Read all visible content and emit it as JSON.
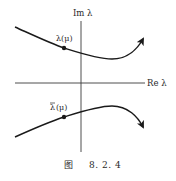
{
  "figure": {
    "caption_prefix": "图",
    "caption_number": "8. 2. 4",
    "axes": {
      "imag_label": "Im λ",
      "real_label": "Re λ"
    },
    "points": {
      "upper_label": "λ(μ)",
      "lower_label_bar": "λ",
      "lower_label_rest": "(μ)"
    },
    "colors": {
      "ink": "#1a1a1a",
      "axis": "#3a3a3a",
      "background": "#ffffff"
    }
  }
}
